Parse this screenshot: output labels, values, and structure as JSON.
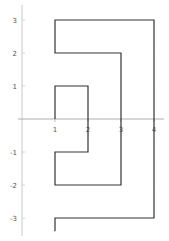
{
  "chart_data": {
    "type": "line",
    "title": "",
    "xlabel": "",
    "ylabel": "",
    "xlim": [
      0,
      4.2
    ],
    "ylim": [
      -3.4,
      3.4
    ],
    "grid": false,
    "x_ticks": [
      "1",
      "2",
      "3",
      "4"
    ],
    "y_ticks": [
      "3",
      "2",
      "1",
      "-1",
      "-2",
      "-3"
    ],
    "series": [
      {
        "name": "path",
        "color": "#333333",
        "points": [
          [
            1,
            -3.4
          ],
          [
            1,
            -3
          ],
          [
            4,
            -3
          ],
          [
            4,
            3
          ],
          [
            1,
            3
          ],
          [
            1,
            2
          ],
          [
            3,
            2
          ],
          [
            3,
            -2
          ],
          [
            1,
            -2
          ],
          [
            1,
            -1
          ],
          [
            2,
            -1
          ],
          [
            2,
            1
          ],
          [
            1,
            1
          ],
          [
            1,
            0
          ]
        ]
      }
    ]
  }
}
